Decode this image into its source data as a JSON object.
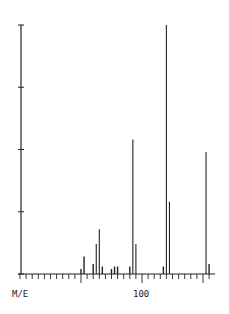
{
  "chart_data": {
    "type": "bar",
    "title": "",
    "xlabel": "M/E",
    "ylabel": "",
    "xlim": [
      60,
      125
    ],
    "ylim": [
      0,
      100
    ],
    "x_major_ticks": [
      60,
      80,
      100,
      120
    ],
    "x_minor_step": 2,
    "x_tick_labels": [
      {
        "value": 100,
        "label": "100"
      }
    ],
    "y_ticks": [
      0,
      25,
      50,
      75,
      100
    ],
    "grid": false,
    "legend": null,
    "series": [
      {
        "name": "relative intensity",
        "x": [
          80,
          81,
          84,
          85,
          86,
          87,
          90,
          91,
          92,
          96,
          97,
          98,
          107,
          108,
          109,
          121,
          122
        ],
        "values": [
          2,
          7,
          4,
          12,
          18,
          3,
          2,
          3,
          3,
          3,
          54,
          12,
          3,
          100,
          29,
          49,
          4
        ]
      }
    ],
    "colors": {
      "line": "#222222",
      "background": "#ffffff"
    }
  },
  "axis": {
    "x_label": "M/E",
    "x_tick_label_100": "100"
  }
}
